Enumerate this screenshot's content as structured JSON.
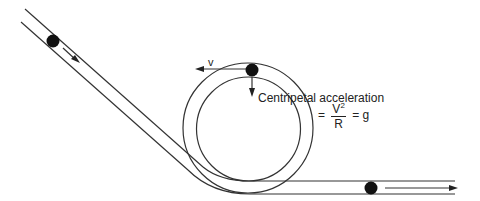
{
  "diagram": {
    "labels": {
      "velocity": "v",
      "centripetal_title": "Centripetal acceleration",
      "eq_prefix": "=",
      "numerator": "V",
      "numerator_exp": "2",
      "denominator": "R",
      "eq_suffix": "= g"
    },
    "colors": {
      "line": "#333333",
      "ball": "#111111"
    }
  }
}
